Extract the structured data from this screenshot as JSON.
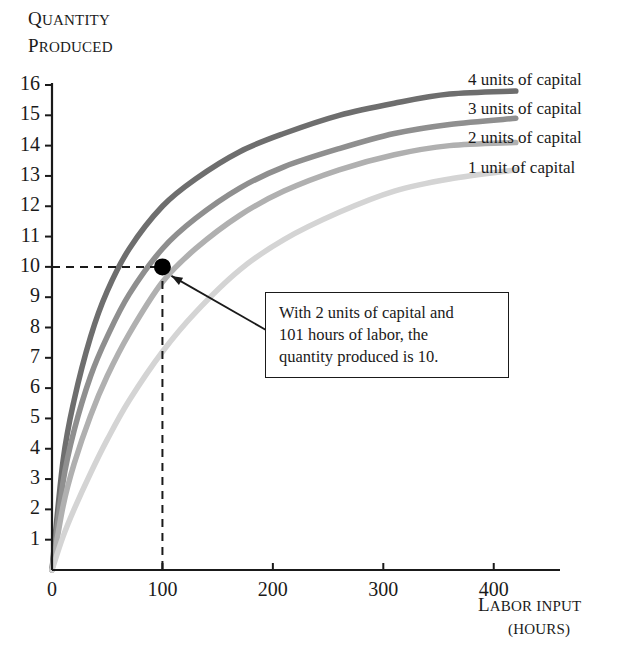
{
  "chart_data": {
    "type": "line",
    "title": "",
    "ylabel_line1": "Quantity",
    "ylabel_line2": "Produced",
    "xlabel_line1": "Labor Input",
    "xlabel_line2": "(Hours)",
    "xlim": [
      0,
      460
    ],
    "ylim": [
      0,
      16
    ],
    "grid": false,
    "legend_position": "right-inside",
    "x_ticks": [
      100,
      200,
      300,
      400
    ],
    "y_ticks": [
      1,
      2,
      3,
      4,
      5,
      6,
      7,
      8,
      9,
      10,
      11,
      12,
      13,
      14,
      15,
      16
    ],
    "x_origin_label": "0",
    "series": [
      {
        "name": "4 units of capital",
        "color": "#6e6e6e",
        "x": [
          0,
          10,
          20,
          35,
          50,
          70,
          100,
          130,
          170,
          210,
          260,
          310,
          360,
          420
        ],
        "values": [
          0,
          3.6,
          5.6,
          7.7,
          9.2,
          10.6,
          12.0,
          12.9,
          13.8,
          14.4,
          15.0,
          15.4,
          15.7,
          15.8
        ]
      },
      {
        "name": "3 units of capital",
        "color": "#8f8f8f",
        "x": [
          0,
          10,
          20,
          35,
          50,
          70,
          100,
          130,
          170,
          210,
          260,
          310,
          360,
          420
        ],
        "values": [
          0,
          2.9,
          4.6,
          6.4,
          7.7,
          9.1,
          10.6,
          11.6,
          12.6,
          13.3,
          13.9,
          14.4,
          14.7,
          14.9
        ]
      },
      {
        "name": "2 units of capital",
        "color": "#b0b0b0",
        "x": [
          0,
          10,
          20,
          35,
          50,
          70,
          100,
          130,
          170,
          210,
          260,
          310,
          360,
          420
        ],
        "values": [
          0,
          2.1,
          3.5,
          5.1,
          6.4,
          7.8,
          9.5,
          10.6,
          11.7,
          12.5,
          13.2,
          13.7,
          14.0,
          14.1
        ]
      },
      {
        "name": "1 unit of capital",
        "color": "#d4d4d4",
        "x": [
          0,
          10,
          20,
          35,
          50,
          70,
          100,
          130,
          170,
          210,
          260,
          310,
          360,
          420
        ],
        "values": [
          0,
          1.1,
          2.0,
          3.2,
          4.3,
          5.6,
          7.2,
          8.5,
          9.9,
          10.9,
          11.8,
          12.5,
          12.9,
          13.2
        ]
      }
    ],
    "highlight_point": {
      "x": 100,
      "y": 10,
      "color": "#000000",
      "guide_x_value": 100,
      "guide_y_value": 10
    },
    "annotation": {
      "line1": "With 2 units of capital and",
      "line2": "101 hours of labor, the",
      "line3": "quantity produced is 10."
    }
  },
  "legend": {
    "items": [
      {
        "label": "4 units of capital"
      },
      {
        "label": "3 units of capital"
      },
      {
        "label": "2 units of capital"
      },
      {
        "label": "1 unit of capital"
      }
    ]
  },
  "axes": {
    "y_title_cap": "Q",
    "y_title_rest": "UANTITY",
    "y_title_cap2": "P",
    "y_title_rest2": "RODUCED",
    "x_title_cap": "L",
    "x_title_rest": "ABOR INPUT",
    "x_units": "(HOURS)"
  }
}
